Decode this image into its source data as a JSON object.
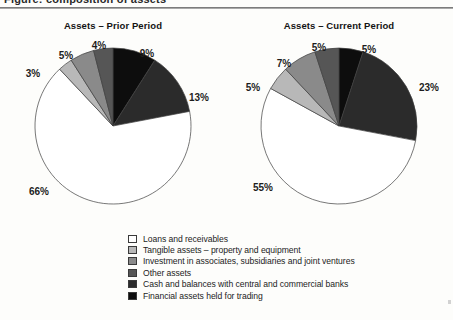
{
  "document": {
    "top_fragment_text": "Figure: composition of assets",
    "has_top_rule": true
  },
  "legend": {
    "items": [
      {
        "label": "Loans and receivables",
        "color": "#ffffff"
      },
      {
        "label": "Tangible assets – property and equipment",
        "color": "#b8b8b8"
      },
      {
        "label": "Investment in associates, subsidiaries and joint ventures",
        "color": "#8a8a8a"
      },
      {
        "label": "Other assets",
        "color": "#565656"
      },
      {
        "label": "Cash and balances with central and commercial banks",
        "color": "#2b2b2b"
      },
      {
        "label": "Financial assets held for trading",
        "color": "#0d0d0d"
      }
    ]
  },
  "charts": [
    {
      "id": "prior",
      "title": "Assets – Prior Period",
      "labels": [
        "9%",
        "13%",
        "66%",
        "3%",
        "5%",
        "4%"
      ]
    },
    {
      "id": "current",
      "title": "Assets – Current Period",
      "labels": [
        "5%",
        "23%",
        "55%",
        "5%",
        "7%",
        "5%"
      ]
    }
  ],
  "chart_data": [
    {
      "type": "pie",
      "title": "Assets – Prior Period",
      "categories": [
        "Financial assets held for trading",
        "Cash and balances with central and commercial banks",
        "Loans and receivables",
        "Tangible assets – property and equipment",
        "Investment in associates, subsidiaries and joint ventures",
        "Other assets"
      ],
      "values": [
        9,
        13,
        66,
        3,
        5,
        4
      ],
      "value_labels": [
        "9%",
        "13%",
        "66%",
        "3%",
        "5%",
        "4%"
      ],
      "colors": [
        "#0d0d0d",
        "#2b2b2b",
        "#ffffff",
        "#b8b8b8",
        "#8a8a8a",
        "#565656"
      ],
      "units": "percent",
      "total": 100,
      "start_angle_deg": 0,
      "direction": "clockwise",
      "legend_position": "bottom",
      "grid": false
    },
    {
      "type": "pie",
      "title": "Assets – Current Period",
      "categories": [
        "Financial assets held for trading",
        "Cash and balances with central and commercial banks",
        "Loans and receivables",
        "Tangible assets – property and equipment",
        "Investment in associates, subsidiaries and joint ventures",
        "Other assets"
      ],
      "values": [
        5,
        23,
        55,
        5,
        7,
        5
      ],
      "value_labels": [
        "5%",
        "23%",
        "55%",
        "5%",
        "7%",
        "5%"
      ],
      "colors": [
        "#0d0d0d",
        "#2b2b2b",
        "#ffffff",
        "#b8b8b8",
        "#8a8a8a",
        "#565656"
      ],
      "units": "percent",
      "total": 100,
      "start_angle_deg": 0,
      "direction": "clockwise",
      "legend_position": "bottom",
      "grid": false
    }
  ]
}
